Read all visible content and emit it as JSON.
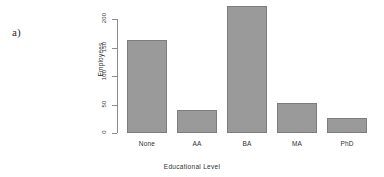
{
  "figure": {
    "panel_label": "a)",
    "background_color": "#ffffff"
  },
  "chart_data": {
    "type": "bar",
    "title": "",
    "xlabel": "Educational Level",
    "ylabel": "Employees",
    "categories": [
      "None",
      "AA",
      "BA",
      "MA",
      "PhD"
    ],
    "values": [
      163,
      40,
      222,
      53,
      27
    ],
    "ylim": [
      0,
      230
    ],
    "yticks": [
      0,
      50,
      100,
      150,
      200
    ],
    "ytick_labels": [
      "0",
      "50",
      "100",
      "150",
      "200"
    ],
    "grid": false,
    "legend": null,
    "bar_fill_color": "#9a9a9a",
    "bar_border_color": "#7d7d7d",
    "axis_color": "#8c8c8c"
  }
}
